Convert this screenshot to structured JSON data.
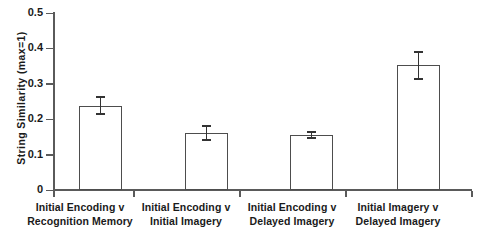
{
  "chart_data": {
    "type": "bar",
    "title": "",
    "xlabel": "",
    "ylabel": "String Similarity (max=1)",
    "ylim": [
      0,
      0.5
    ],
    "ytick_labels": [
      "0",
      "0.1",
      "0.2",
      "0.3",
      "0.4",
      "0.5"
    ],
    "ytick_values": [
      0,
      0.1,
      0.2,
      0.3,
      0.4,
      0.5
    ],
    "grid": false,
    "legend": "none",
    "categories": [
      "Initial Encoding v Recognition Memory",
      "Initial Encoding v Initial Imagery",
      "Initial Encoding v Delayed Imagery",
      "Initial Imagery v Delayed Imagery"
    ],
    "category_lines": [
      [
        "Initial Encoding v",
        "Recognition Memory"
      ],
      [
        "Initial Encoding v",
        "Initial Imagery"
      ],
      [
        "Initial Encoding v",
        "Delayed Imagery"
      ],
      [
        "Initial Imagery v",
        "Delayed Imagery"
      ]
    ],
    "values": [
      0.238,
      0.161,
      0.155,
      0.352
    ],
    "errors": [
      0.024,
      0.02,
      0.009,
      0.038
    ],
    "bar_facecolor": "#ffffff",
    "bar_edgecolor": "#4d4d4d",
    "error_color": "#333333",
    "axis_color": "#5a5a5a",
    "text_color": "#1a1a1a"
  }
}
